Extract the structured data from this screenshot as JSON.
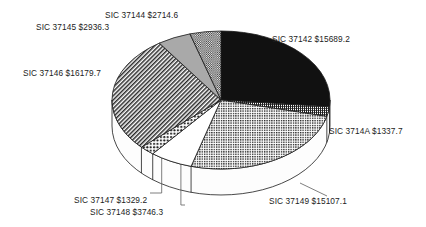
{
  "chart_data": {
    "type": "pie",
    "title": "",
    "subtitle": "",
    "xlabel": "",
    "ylabel": "",
    "legend_position": "none",
    "grid": false,
    "three_d": true,
    "value_prefix": "$",
    "total": 59040.1,
    "categories": [
      "SIC 37142",
      "SIC 3714A",
      "SIC 37149",
      "SIC 37148",
      "SIC 37147",
      "SIC 37146",
      "SIC 37145",
      "SIC 37144"
    ],
    "values": [
      15689.2,
      1337.7,
      15107.1,
      3746.3,
      1329.2,
      16179.7,
      2936.3,
      2714.6
    ],
    "slices": [
      {
        "key": "s37142",
        "label": "SIC 37142 $15689.2",
        "category": "SIC 37142",
        "value": 15689.2,
        "percent": 26.6,
        "fill": "solid-black",
        "color": "#111111"
      },
      {
        "key": "s3714A",
        "label": "SIC 3714A $1337.7",
        "category": "SIC 3714A",
        "value": 1337.7,
        "percent": 2.3,
        "fill": "fine-grid",
        "color": "#3a3a3a"
      },
      {
        "key": "s37149",
        "label": "SIC 37149 $15107.1",
        "category": "SIC 37149",
        "value": 15107.1,
        "percent": 25.6,
        "fill": "dotted-grid",
        "color": "#444444"
      },
      {
        "key": "s37148",
        "label": "SIC 37148 $3746.3",
        "category": "SIC 37148",
        "value": 3746.3,
        "percent": 6.3,
        "fill": "white",
        "color": "#ffffff"
      },
      {
        "key": "s37147",
        "label": "SIC 37147 $1329.2",
        "category": "SIC 37147",
        "value": 1329.2,
        "percent": 2.3,
        "fill": "coarse-dots",
        "color": "#555555"
      },
      {
        "key": "s37146",
        "label": "SIC 37146 $16179.7",
        "category": "SIC 37146",
        "value": 16179.7,
        "percent": 27.4,
        "fill": "diagonal-hatch",
        "color": "#6a6a6a"
      },
      {
        "key": "s37145",
        "label": "SIC 37145 $2936.3",
        "category": "SIC 37145",
        "value": 2936.3,
        "percent": 5.0,
        "fill": "solid-gray",
        "color": "#a8a8a8"
      },
      {
        "key": "s37144",
        "label": "SIC 37144 $2714.6",
        "category": "SIC 37144",
        "value": 2714.6,
        "percent": 4.6,
        "fill": "fine-crosshatch",
        "color": "#6f6f6f"
      }
    ]
  },
  "labels": {
    "s37142": "SIC 37142 $15689.2",
    "s3714A": "SIC 3714A $1337.7",
    "s37149": "SIC 37149 $15107.1",
    "s37148": "SIC 37148 $3746.3",
    "s37147": "SIC 37147 $1329.2",
    "s37146": "SIC 37146 $16179.7",
    "s37145": "SIC 37145 $2936.3",
    "s37144": "SIC 37144 $2714.6"
  },
  "style": {
    "background": "#ffffff",
    "outline": "#1a1a1a",
    "text": "#1b1b1b"
  }
}
